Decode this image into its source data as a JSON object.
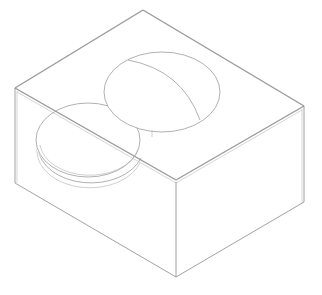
{
  "drawing": {
    "type": "isometric-line-drawing",
    "subject": "rectangular block with a hemispherical dome on top and a flat circular disc protruding from the top-left edge",
    "colors": {
      "background": "#ffffff",
      "line": "#8a8a8a",
      "line_light": "#b8b8b8"
    },
    "block": {
      "top_face": [
        [
          143,
          10
        ],
        [
          304,
          106
        ],
        [
          176,
          180
        ],
        [
          15,
          88
        ]
      ],
      "left_face": [
        [
          15,
          88
        ],
        [
          176,
          180
        ],
        [
          176,
          277
        ],
        [
          15,
          183
        ]
      ],
      "right_face": [
        [
          176,
          180
        ],
        [
          304,
          106
        ],
        [
          304,
          202
        ],
        [
          176,
          277
        ]
      ]
    },
    "dome": {
      "center": [
        162,
        92
      ],
      "rx": 58,
      "ry": 40,
      "meridian": "M130,60 Q185,75 200,120"
    },
    "disc": {
      "top_center": [
        88,
        140
      ],
      "rx": 53,
      "ry": 37,
      "thickness": 8
    }
  }
}
